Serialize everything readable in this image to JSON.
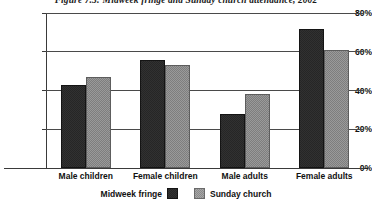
{
  "chart_data": {
    "type": "bar",
    "title": "Figure 7.3: Midweek fringe and Sunday church attendance, 2002",
    "xlabel": "",
    "ylabel": "",
    "categories": [
      "Male children",
      "Female children",
      "Male adults",
      "Female adults"
    ],
    "series": [
      {
        "name": "Midweek fringe",
        "color": "#262626",
        "values": [
          43,
          56,
          28,
          72
        ]
      },
      {
        "name": "Sunday church",
        "color": "#7e7e7e",
        "values": [
          47,
          53,
          38,
          61
        ]
      }
    ],
    "ylim": [
      0,
      80
    ],
    "yticks": [
      0,
      20,
      40,
      60,
      80
    ],
    "ytick_labels": [
      "0%",
      "20%",
      "40%",
      "60%",
      "80%"
    ],
    "grid": true,
    "legend_position": "bottom"
  }
}
